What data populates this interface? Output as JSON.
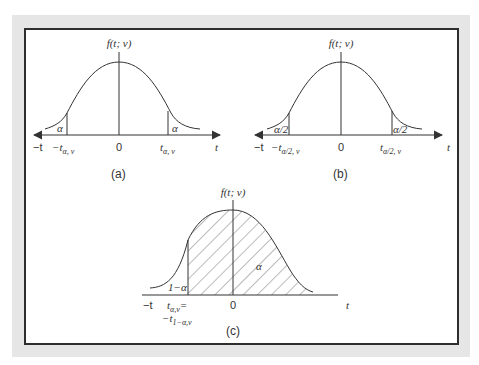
{
  "figure": {
    "panels": [
      {
        "id": "a",
        "caption": "(a)",
        "y_label": "f(t; v)",
        "axis_left": "−t",
        "axis_right": "t",
        "zero": "0",
        "left_cut_label": "−t",
        "left_cut_sub": "α, v",
        "right_cut_label": "t",
        "right_cut_sub": "α, v",
        "left_tail": "α",
        "right_tail": "α"
      },
      {
        "id": "b",
        "caption": "(b)",
        "y_label": "f(t; v)",
        "axis_left": "−t",
        "axis_right": "t",
        "zero": "0",
        "left_cut_label": "−t",
        "left_cut_sub": "α/2, v",
        "right_cut_label": "t",
        "right_cut_sub": "α/2, v",
        "left_tail": "α/2",
        "right_tail": "α/2"
      },
      {
        "id": "c",
        "caption": "(c)",
        "y_label": "f(t; v)",
        "axis_left": "−t",
        "axis_right": "t",
        "zero": "0",
        "cut_label_1": "t",
        "cut_sub_1": "α,v",
        "cut_eq": "=",
        "cut_label_2": "−t",
        "cut_sub_2": "1−α,v",
        "left_tail": "1−α",
        "shaded_label": "α"
      }
    ]
  },
  "colors": {
    "frame": "#2e2e2e",
    "outer": "#e6e6e6",
    "ink": "#333333"
  }
}
